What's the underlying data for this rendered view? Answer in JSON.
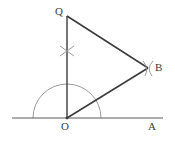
{
  "figure": {
    "width": 175,
    "height": 141,
    "background_color": "#ffffff"
  },
  "colors": {
    "line_color": "#3c3c3c",
    "arc_color": "#909090",
    "label_color": "#3c3c3c",
    "baseline_color": "#5a5a5a"
  },
  "labels": {
    "Q": "Q",
    "B": "B",
    "O": "O",
    "A": "A"
  },
  "points": {
    "O": {
      "x": 67,
      "y": 118,
      "name": "O"
    },
    "Q": {
      "x": 67,
      "y": 16,
      "name": "Q"
    },
    "B": {
      "x": 148,
      "y": 68,
      "name": "B"
    },
    "A": {
      "x": 152,
      "y": 118,
      "name": "A"
    }
  },
  "segments": [
    {
      "name": "baseline-OA",
      "x1": 12,
      "y1": 118,
      "x2": 163,
      "y2": 118
    },
    {
      "name": "segment-OQ",
      "x1": 67,
      "y1": 16,
      "x2": 67,
      "y2": 118
    },
    {
      "name": "segment-OB",
      "x1": 67,
      "y1": 118,
      "x2": 148,
      "y2": 68
    },
    {
      "name": "segment-QB",
      "x1": 67,
      "y1": 16,
      "x2": 148,
      "y2": 68
    }
  ],
  "arcs": {
    "semicircle": {
      "name": "construction-semicircle",
      "center_x": 67,
      "center_y": 118,
      "radius": 34,
      "start_angle_deg": 180,
      "end_angle_deg": 0
    },
    "cross_mark_vertical": {
      "name": "arc-intersection-mark-on-OQ",
      "center_x": 67,
      "center_y": 51,
      "size": 9
    },
    "cross_mark_B": {
      "name": "arc-intersection-mark-at-B",
      "center_x": 148,
      "center_y": 68,
      "size": 9
    }
  }
}
